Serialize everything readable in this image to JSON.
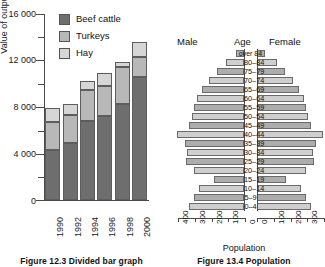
{
  "figures": {
    "left": {
      "caption": "Figure 12.3  Divided bar graph",
      "ylabel": "Value of output (£)",
      "legend_title": "",
      "legend": [
        {
          "label": "Beef cattle",
          "color": "#6e6e6e"
        },
        {
          "label": "Turkeys",
          "color": "#b8b8b8"
        },
        {
          "label": "Hay",
          "color": "#d6d6d6"
        }
      ],
      "ytick_labels": [
        "16 000",
        "12 000",
        "8 000",
        "4 000",
        "0"
      ],
      "xtick_labels": [
        "1990",
        "1992",
        "1994",
        "1996",
        "1998",
        "2000"
      ]
    },
    "right": {
      "caption": "Figure 13.4  Population",
      "male_label": "Male",
      "age_label": "Age",
      "female_label": "Female",
      "xtitle": "Population",
      "xtick_labels_left": [
        "400",
        "300",
        "200",
        "100",
        "0"
      ],
      "xtick_labels_right": [
        "0",
        "100",
        "200",
        "300",
        "400"
      ]
    }
  },
  "chart_data": [
    {
      "type": "bar",
      "id": "divided-bar-graph",
      "title": "Figure 12.3  Divided bar graph",
      "subtitle": "",
      "stacked": true,
      "xlabel": "",
      "ylabel": "Value of output (£)",
      "ylim": [
        0,
        16000
      ],
      "yticks": [
        0,
        4000,
        8000,
        12000,
        16000
      ],
      "yminor_ticks": [
        2000,
        6000,
        10000,
        14000
      ],
      "grid": false,
      "legend_position": "top-left-inside",
      "categories": [
        "1990",
        "1992",
        "1994",
        "1996",
        "1998",
        "2000"
      ],
      "series": [
        {
          "name": "Beef cattle",
          "color": "#6e6e6e",
          "values": [
            4300,
            4900,
            6800,
            7200,
            8300,
            10600
          ]
        },
        {
          "name": "Turkeys",
          "color": "#b8b8b8",
          "values": [
            2400,
            2400,
            2700,
            2600,
            3100,
            1700
          ]
        },
        {
          "name": "Hay",
          "color": "#d6d6d6",
          "values": [
            1200,
            1000,
            700,
            1100,
            500,
            1300
          ]
        }
      ],
      "totals": [
        7900,
        8300,
        10200,
        10900,
        11900,
        13600
      ]
    },
    {
      "type": "bar",
      "id": "population-pyramid",
      "title": "Figure 13.4  Population",
      "orientation": "horizontal",
      "layout": "pyramid",
      "xlabel": "Population",
      "ylabel": "Age",
      "xlim": [
        0,
        400
      ],
      "xticks": [
        0,
        100,
        200,
        300,
        400
      ],
      "grid": false,
      "categories": [
        "0–4",
        "5–9",
        "10–14",
        "15–19",
        "20–24",
        "25–29",
        "30–34",
        "35–39",
        "40–44",
        "45–49",
        "50–54",
        "55–59",
        "60–64",
        "65–69",
        "70–74",
        "75–79",
        "80–84",
        "over 84"
      ],
      "series": [
        {
          "name": "Male",
          "side": "left",
          "values": [
            330,
            300,
            270,
            180,
            300,
            345,
            340,
            350,
            400,
            330,
            310,
            300,
            280,
            250,
            210,
            160,
            110,
            45
          ]
        },
        {
          "name": "Female",
          "side": "right",
          "values": [
            320,
            290,
            260,
            175,
            295,
            340,
            335,
            350,
            395,
            325,
            305,
            295,
            280,
            250,
            215,
            170,
            120,
            50
          ]
        }
      ]
    }
  ]
}
